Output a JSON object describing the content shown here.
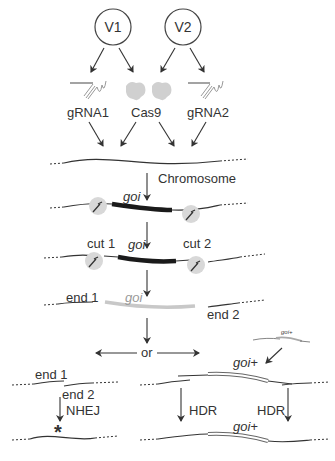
{
  "vectors": [
    {
      "label": "V1"
    },
    {
      "label": "V2"
    }
  ],
  "components": {
    "grna1": "gRNA1",
    "cas9": "Cas9",
    "grna2": "gRNA2"
  },
  "chromosome": {
    "label": "Chromosome"
  },
  "gene": {
    "label": "goi",
    "repaired_label": "goi+",
    "donor_label": "goi+"
  },
  "cuts": {
    "cut1": "cut 1",
    "cut2": "cut 2"
  },
  "ends": {
    "end1": "end 1",
    "end2": "end 2",
    "nhej_end1": "end 1",
    "nhej_end2": "end 2"
  },
  "branch": {
    "label": "or"
  },
  "pathways": {
    "nhej": "NHEJ",
    "hdr_left": "HDR",
    "hdr_right": "HDR",
    "mutation_mark": "*"
  },
  "colors": {
    "line": "#333333",
    "gene_bar": "#1a1a1a",
    "cas9_gray": "#d0d0d0",
    "cut_gene": "#c8c8c8"
  }
}
